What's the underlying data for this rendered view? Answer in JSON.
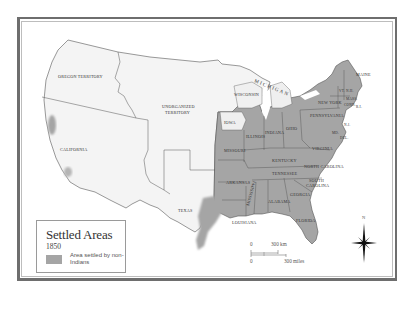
{
  "map": {
    "colors": {
      "settled": "#a5a5a5",
      "unsettled": "#f4f4f4",
      "border": "#555555",
      "frame": "#6e6e6e"
    },
    "territories": [
      {
        "name": "OREGON TERRITORY"
      },
      {
        "name": "UNORGANIZED TERRITORY",
        "line1": "UNORGANIZED",
        "line2": "TERRITORY"
      },
      {
        "name": "CALIFORNIA"
      },
      {
        "name": "TEXAS"
      },
      {
        "name": "MICHIGAN"
      },
      {
        "name": "WISCONSIN"
      },
      {
        "name": "IOWA"
      }
    ],
    "settled_states": [
      {
        "name": "MISSOURI"
      },
      {
        "name": "ILLINOIS"
      },
      {
        "name": "INDIANA"
      },
      {
        "name": "OHIO"
      },
      {
        "name": "KENTUCKY"
      },
      {
        "name": "TENNESSEE"
      },
      {
        "name": "ARKANSAS"
      },
      {
        "name": "MISSISSIPPI"
      },
      {
        "name": "ALABAMA"
      },
      {
        "name": "GEORGIA"
      },
      {
        "name": "LOUISIANA"
      },
      {
        "name": "FLORIDA"
      },
      {
        "name": "SOUTH CAROLINA",
        "line1": "SOUTH",
        "line2": "CAROLINA"
      },
      {
        "name": "NORTH CAROLINA"
      },
      {
        "name": "VIRGINIA"
      },
      {
        "name": "PENNSYLVANIA"
      },
      {
        "name": "NEW YORK"
      },
      {
        "name": "MAINE"
      },
      {
        "name": "VT."
      },
      {
        "name": "N.H."
      },
      {
        "name": "MASS."
      },
      {
        "name": "CONN."
      },
      {
        "name": "R.I."
      },
      {
        "name": "MD."
      },
      {
        "name": "DEL."
      },
      {
        "name": "N.J."
      }
    ]
  },
  "legend": {
    "title": "Settled Areas",
    "year": "1850",
    "swatch_label": "Area settled by non-Indians"
  },
  "scale": {
    "km_zero": "0",
    "km_label": "300 km",
    "mi_zero": "0",
    "mi_label": "300 miles"
  },
  "compass": {
    "north_label": "N"
  }
}
